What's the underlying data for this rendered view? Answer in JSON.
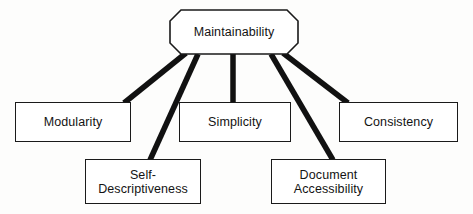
{
  "diagram": {
    "type": "hierarchy-tree",
    "background_color": "#fdfdfc",
    "line_color": "#111111",
    "text_color": "#131313",
    "root": {
      "id": "maintainability",
      "label": "Maintainability",
      "shape": "octagon"
    },
    "children": [
      {
        "id": "modularity",
        "label": "Modularity",
        "shape": "rectangle",
        "row": "middle"
      },
      {
        "id": "self-descriptiveness",
        "label": "Self-\nDescriptiveness",
        "shape": "rectangle",
        "row": "bottom"
      },
      {
        "id": "simplicity",
        "label": "Simplicity",
        "shape": "rectangle",
        "row": "middle"
      },
      {
        "id": "document-accessibility",
        "label": "Document\nAccessibility",
        "shape": "rectangle",
        "row": "bottom"
      },
      {
        "id": "consistency",
        "label": "Consistency",
        "shape": "rectangle",
        "row": "middle"
      }
    ],
    "connectors": [
      {
        "from": "maintainability",
        "to": "modularity"
      },
      {
        "from": "maintainability",
        "to": "self-descriptiveness"
      },
      {
        "from": "maintainability",
        "to": "simplicity"
      },
      {
        "from": "maintainability",
        "to": "document-accessibility"
      },
      {
        "from": "maintainability",
        "to": "consistency"
      }
    ]
  }
}
